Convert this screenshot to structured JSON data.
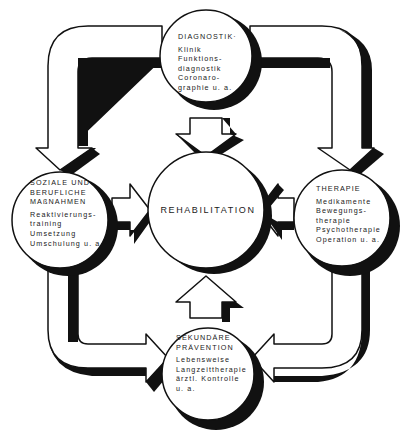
{
  "diagram": {
    "center": {
      "label": "REHABILITATION"
    },
    "nodes": {
      "top": {
        "title": "DIAGNOSTIK·",
        "items": [
          "Klinik",
          "Funktions-",
          "diagnostik",
          "Coronaro-",
          "graphie u. a."
        ]
      },
      "left": {
        "title_lines": [
          "SOZIALE UND",
          "BERUFLICHE",
          "MAßNAHMEN"
        ],
        "items": [
          "Reaktivierungs-",
          "training",
          "Umsetzung",
          "Umschulung u. a."
        ]
      },
      "right": {
        "title": "THERAPIE",
        "items": [
          "Medikamente",
          "Bewegungs-",
          "therapie",
          "Psychotherapie",
          "Operation u. a."
        ]
      },
      "bottom": {
        "title_lines": [
          "SEKUNDÄRE",
          "PRÄVENTION"
        ],
        "items": [
          "Lebensweise",
          "Langzeittherapie",
          "ärztl. Kontrolle",
          "u. a."
        ]
      }
    },
    "flows": [
      "Diagnostik → Rehabilitation",
      "Soziale und berufliche Maßnahmen → Rehabilitation",
      "Therapie → Rehabilitation",
      "Sekundäre Prävention → Rehabilitation",
      "Diagnostik → Soziale und berufliche Maßnahmen",
      "Diagnostik → Therapie",
      "Therapie → Sekundäre Prävention",
      "Soziale und berufliche Maßnahmen → Sekundäre Prävention"
    ],
    "colors": {
      "ink": "#111111",
      "paper": "#ffffff"
    }
  }
}
